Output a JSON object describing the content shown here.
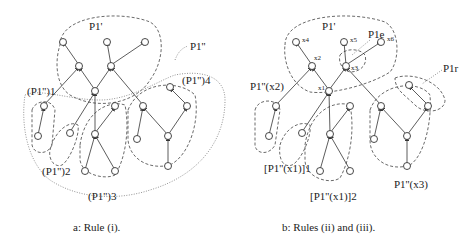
{
  "figure": {
    "panel_a": {
      "caption": "a: Rule (i).",
      "labels": {
        "p1_prime": "P1'",
        "p1_double_prime": "P1''",
        "sub1": "(P1'')1",
        "sub2": "(P1'')2",
        "sub3": "(P1'')3",
        "sub4": "(P1'')4"
      }
    },
    "panel_b": {
      "caption": "b: Rules (ii) and (iii).",
      "labels": {
        "p1_prime": "P1'",
        "p1_e": "P1e",
        "p1_r": "P1r",
        "p_x2": "P1''(x2)",
        "p_x1_1": "[P1''(x1)]1",
        "p_x1_2": "[P1''(x1)]2",
        "p_x3": "P1''(x3)",
        "x4": "x4",
        "x5": "x5",
        "x6": "x6",
        "x2": "x2",
        "x1": "x1",
        "x3": "x3"
      }
    }
  }
}
